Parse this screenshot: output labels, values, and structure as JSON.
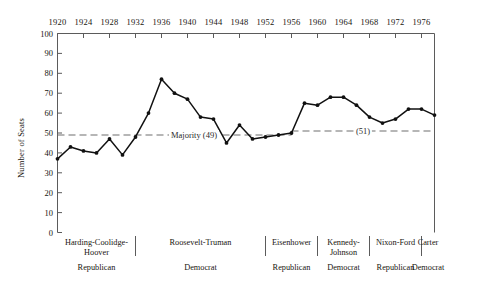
{
  "chart_data": {
    "type": "line",
    "title": "",
    "xlabel": "",
    "ylabel": "Number of Seats",
    "ylim": [
      0,
      100
    ],
    "xlim": [
      1920,
      1978
    ],
    "ytick_step": 10,
    "yticks": [
      0,
      10,
      20,
      30,
      40,
      50,
      60,
      70,
      80,
      90,
      100
    ],
    "xticks": [
      1920,
      1924,
      1928,
      1932,
      1936,
      1940,
      1944,
      1948,
      1952,
      1956,
      1960,
      1964,
      1968,
      1972,
      1976
    ],
    "xtick_labels": [
      "1920",
      "1924",
      "1928",
      "1932",
      "1936",
      "1940",
      "1944",
      "1948",
      "1952",
      "1956",
      "1960",
      "1964",
      "1968",
      "1972",
      "1976"
    ],
    "axis_position": "x-axis-on-top",
    "grid": false,
    "legend": "none",
    "series": [
      {
        "name": "Seats",
        "marker": "filled-circle",
        "color": "#111111",
        "x": [
          1920,
          1922,
          1924,
          1926,
          1928,
          1930,
          1932,
          1934,
          1936,
          1938,
          1940,
          1942,
          1944,
          1946,
          1948,
          1950,
          1952,
          1954,
          1956,
          1958,
          1960,
          1962,
          1964,
          1966,
          1968,
          1970,
          1972,
          1974,
          1976,
          1978
        ],
        "values": [
          37,
          43,
          41,
          40,
          47,
          39,
          48,
          60,
          77,
          70,
          67,
          58,
          57,
          45,
          54,
          47,
          48,
          49,
          50,
          65,
          64,
          68,
          68,
          64,
          58,
          55,
          57,
          62,
          62,
          59
        ]
      }
    ],
    "reference_lines": [
      {
        "name": "majority-49",
        "label": "Majority (49)",
        "value": 49,
        "style": "dashed",
        "x_start": 1920,
        "x_end": 1956,
        "label_x": 1941
      },
      {
        "name": "majority-51",
        "label": "(51)",
        "value": 51,
        "style": "dashed",
        "x_start": 1956,
        "x_end": 1978,
        "label_x": 1967
      }
    ],
    "annotations": {
      "eras": [
        {
          "name": "Harding-Coolidge-Hoover",
          "party": "Republican",
          "x_start": 1920,
          "x_end": 1932
        },
        {
          "name": "Roosevelt-Truman",
          "party": "Democrat",
          "x_start": 1932,
          "x_end": 1952
        },
        {
          "name": "Eisenhower",
          "party": "Republican",
          "x_start": 1952,
          "x_end": 1960
        },
        {
          "name": "Kennedy-Johnson",
          "party": "Democrat",
          "x_start": 1960,
          "x_end": 1968
        },
        {
          "name": "Nixon-Ford",
          "party": "Republican",
          "x_start": 1968,
          "x_end": 1976
        },
        {
          "name": "Carter",
          "party": "Democrat",
          "x_start": 1976,
          "x_end": 1978
        }
      ]
    }
  },
  "colors": {
    "line": "#111111",
    "axis": "#5b5b5b",
    "reference": "#6e6e6e",
    "text": "#18150f",
    "background": "#ffffff"
  }
}
